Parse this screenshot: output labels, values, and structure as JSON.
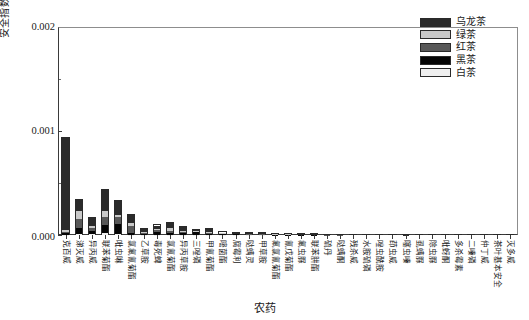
{
  "chart_data": {
    "type": "bar",
    "stacked": true,
    "title": "",
    "xlabel": "农药",
    "ylabel": "安全指数 IFSc",
    "ylabel_main": "安全指数 IFS",
    "ylabel_sub": "c",
    "ylim": [
      0,
      0.002
    ],
    "yticks": [
      0,
      0.001,
      0.002
    ],
    "ytick_labels": [
      "0.000",
      "0.001",
      "0.002"
    ],
    "yminor_ticks": [
      0.0005,
      0.0015
    ],
    "grid": false,
    "legend_position": "top-right",
    "series": [
      {
        "name": "乌龙茶",
        "color": "#2b2b2b",
        "values": [
          0.0009,
          0.00011,
          9e-05,
          0.00021,
          0.00014,
          8e-05,
          3.5e-05,
          4e-05,
          5e-05,
          4e-05,
          1.2e-05,
          3.5e-05,
          1.2e-05,
          1e-05,
          1e-05,
          1.2e-05,
          8e-06,
          8e-06,
          6e-06,
          6e-06,
          5e-06,
          5e-06,
          4e-06,
          4e-06,
          3e-06,
          3e-06,
          3e-06,
          2e-06,
          2e-06,
          2e-06,
          1e-06,
          1e-06,
          1e-06,
          1e-06,
          1e-06
        ]
      },
      {
        "name": "绿茶",
        "color": "#c9c9c9",
        "values": [
          2e-05,
          8e-05,
          1.5e-05,
          6e-05,
          1.5e-05,
          3e-05,
          1.5e-05,
          1e-05,
          3.5e-05,
          1e-05,
          5e-06,
          8e-06,
          5e-06,
          4e-06,
          4e-06,
          4e-06,
          3e-06,
          3e-06,
          2e-06,
          2e-06,
          2e-06,
          2e-06,
          1e-06,
          1e-06,
          1e-06,
          1e-06,
          1e-06,
          1e-06,
          1e-06,
          1e-06,
          1e-06,
          1e-06,
          1e-06,
          1e-06,
          1e-06
        ]
      },
      {
        "name": "红茶",
        "color": "#585858",
        "values": [
          1.5e-05,
          9e-05,
          3.5e-05,
          7.5e-05,
          7.5e-05,
          6.5e-05,
          1e-05,
          1.8e-05,
          2.2e-05,
          1.6e-05,
          8e-06,
          1.4e-05,
          7e-06,
          6e-06,
          6e-06,
          6e-06,
          4e-06,
          4e-06,
          3e-06,
          3e-06,
          3e-06,
          3e-06,
          2e-06,
          2e-06,
          2e-06,
          2e-06,
          1e-06,
          1e-06,
          1e-06,
          1e-06,
          1e-06,
          1e-06,
          1e-06,
          1e-06,
          1e-06
        ]
      },
      {
        "name": "黑茶",
        "color": "#050505",
        "values": [
          1e-05,
          5.5e-05,
          3e-05,
          8e-05,
          9.5e-05,
          2e-05,
          8e-06,
          3e-05,
          1.6e-05,
          1.4e-05,
          3e-05,
          1e-05,
          8e-06,
          6e-06,
          5e-06,
          5e-06,
          4e-06,
          4e-06,
          3e-06,
          3e-06,
          2e-06,
          2e-06,
          2e-06,
          2e-06,
          1e-06,
          1e-06,
          1e-06,
          1e-06,
          1e-06,
          1e-06,
          1e-06,
          1e-06,
          1e-06,
          1e-06,
          1e-06
        ]
      },
      {
        "name": "白茶",
        "color": "#efefef",
        "values": [
          5e-06,
          1.2e-05,
          8e-06,
          2.2e-05,
          1e-05,
          5e-06,
          4e-06,
          4e-06,
          4e-06,
          3e-06,
          2e-06,
          3e-06,
          2e-06,
          2e-06,
          2e-06,
          2e-06,
          1e-06,
          1e-06,
          1e-06,
          1e-06,
          1e-06,
          1e-06,
          1e-06,
          1e-06,
          1e-06,
          1e-06,
          1e-06,
          1e-06,
          1e-06,
          1e-06,
          1e-06,
          1e-06,
          1e-06,
          1e-06,
          1e-06
        ]
      }
    ],
    "categories": [
      "克百威",
      "涕灭威",
      "异丙威",
      "联苯菊酯",
      "吡虫啉",
      "氯氟氰菊酯",
      "乙草胺",
      "毒死蜱",
      "氯氰菊酯",
      "异丙草胺",
      "三唑磷",
      "甲氰菊酯",
      "嘧菌酯",
      "腐霉利",
      "哒螨灵",
      "甲草胺",
      "氟氯氰菊酯",
      "氰戊菊酯",
      "氟虫脲",
      "联苯肼酯",
      "硫丹",
      "哒螨酮",
      "残杀威",
      "水胺硫磷",
      "唑虫酰胺",
      "茚虫威",
      "噻虫嗪",
      "虱螨脲",
      "除虫脲",
      "吡蚜酮",
      "多杀霉素",
      "二嗪磷",
      "仲丁威",
      "茶叶基本安全",
      "灭多威"
    ]
  },
  "legend": {
    "items": [
      {
        "label": "乌龙茶",
        "swatch": "legend-swatch-oolong"
      },
      {
        "label": "绿茶",
        "swatch": "legend-swatch-green"
      },
      {
        "label": "红茶",
        "swatch": "legend-swatch-red"
      },
      {
        "label": "黑茶",
        "swatch": "legend-swatch-dark"
      },
      {
        "label": "白茶",
        "swatch": "legend-swatch-white"
      }
    ]
  }
}
